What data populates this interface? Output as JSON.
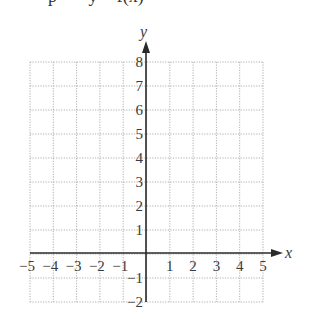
{
  "caption_clipped": "p       y = f(x)",
  "chart_data": {
    "type": "line",
    "title": "",
    "xlabel": "x",
    "ylabel": "y",
    "xlim": [
      -5,
      5
    ],
    "ylim": [
      -2,
      8
    ],
    "grid": true,
    "grid_style": "dotted",
    "x_ticks": [
      -5,
      -4,
      -3,
      -2,
      -1,
      1,
      2,
      3,
      4,
      5
    ],
    "y_ticks": [
      -2,
      -1,
      1,
      2,
      3,
      4,
      5,
      6,
      7,
      8
    ],
    "x_tick_labels": [
      "−5",
      "−4",
      "−3",
      "−2",
      "−1",
      "1",
      "2",
      "3",
      "4",
      "5"
    ],
    "y_tick_labels": [
      "−2",
      "−1",
      "1",
      "2",
      "3",
      "4",
      "5",
      "6",
      "7",
      "8"
    ],
    "series": []
  },
  "colors": {
    "axis": "#2a2a2a",
    "grid": "#9a9a9a",
    "text": "#3a3a3a"
  }
}
